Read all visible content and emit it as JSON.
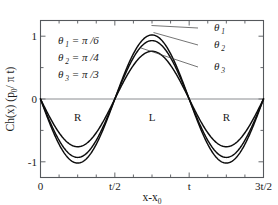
{
  "chart_data": {
    "type": "line",
    "title": "",
    "xlabel": "x-x",
    "xlabel_sub": "0",
    "ylabel": "Ch(x) (p",
    "ylabel_sub": "0",
    "ylabel_tail": "/ π t)",
    "xlim": [
      0,
      1.5
    ],
    "ylim": [
      -1.25,
      1.25
    ],
    "grid": false,
    "legend_position": "upper-left-inside",
    "x_ticks": [
      {
        "value": 0,
        "label": "0"
      },
      {
        "value": 0.5,
        "label": "t/2"
      },
      {
        "value": 1.0,
        "label": "t"
      },
      {
        "value": 1.5,
        "label": "3t/2"
      }
    ],
    "x_minor_ticks": [
      0.125,
      0.25,
      0.375,
      0.625,
      0.75,
      0.875,
      1.125,
      1.25,
      1.375
    ],
    "y_ticks": [
      {
        "value": 1,
        "label": "1"
      },
      {
        "value": 0,
        "label": "0"
      },
      {
        "value": -1,
        "label": "-1"
      }
    ],
    "y_minor_ticks": [
      0.5,
      -0.5
    ],
    "waveform": "negative-sine",
    "period": 1.0,
    "series": [
      {
        "name": "theta1",
        "label": "θ",
        "label_sub": "1",
        "legend": "θ 1 = π /6",
        "theta_value": "π/6",
        "amplitude": 1.02,
        "peak_x": 0.75,
        "peak_y": 1.02,
        "trough_x": 0.25,
        "trough_y": -1.02,
        "zero_crossings": [
          0,
          0.5,
          1.0,
          1.5
        ]
      },
      {
        "name": "theta2",
        "label": "θ",
        "label_sub": "2",
        "legend": "θ 2 = π /4",
        "theta_value": "π/4",
        "amplitude": 0.93,
        "peak_x": 0.75,
        "peak_y": 0.93,
        "trough_x": 0.25,
        "trough_y": -0.93,
        "zero_crossings": [
          0,
          0.5,
          1.0,
          1.5
        ]
      },
      {
        "name": "theta3",
        "label": "θ",
        "label_sub": "3",
        "legend": "θ 3 = π /3",
        "theta_value": "π/3",
        "amplitude": 0.76,
        "peak_x": 0.75,
        "peak_y": 0.76,
        "trough_x": 0.25,
        "trough_y": -0.76,
        "zero_crossings": [
          0,
          0.5,
          1.0,
          1.5
        ]
      }
    ],
    "legend_entries": [
      {
        "symbol": "θ",
        "sub": "1",
        "eq": "= π /6"
      },
      {
        "symbol": "θ",
        "sub": "2",
        "eq": "= π /4"
      },
      {
        "symbol": "θ",
        "sub": "3",
        "eq": "= π /3"
      }
    ],
    "annotations": [
      {
        "name": "region-r-left",
        "text": "R",
        "x": 0.25,
        "y": -0.35
      },
      {
        "name": "region-l-center",
        "text": "L",
        "x": 0.75,
        "y": -0.35
      },
      {
        "name": "region-r-right",
        "text": "R",
        "x": 1.25,
        "y": -0.35
      }
    ]
  }
}
